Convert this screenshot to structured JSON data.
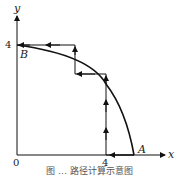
{
  "axes": {
    "x_label": "x",
    "y_label": "y",
    "origin": "0",
    "x_tick": "4",
    "y_tick": "4"
  },
  "points": {
    "A": "A",
    "B": "B"
  },
  "caption": "图 … 路径计算示意图"
}
